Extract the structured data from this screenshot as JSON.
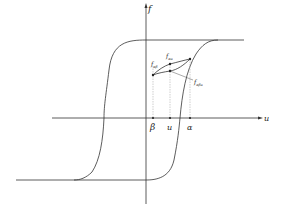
{
  "diagram": {
    "type": "hysteresis-loop",
    "axes": {
      "vertical_label": "f",
      "horizontal_label": "u"
    },
    "tick_labels": {
      "beta": "β",
      "u": "u",
      "alpha": "α"
    },
    "point_labels": {
      "f_ab": {
        "base": "f",
        "sub": "αβ"
      },
      "f_au": {
        "base": "f",
        "sub": "αu"
      },
      "f_abu": {
        "base": "f",
        "sub": "αβu"
      }
    },
    "colors": {
      "line": "#333333",
      "guide": "#b0b0b0",
      "background": "#ffffff"
    }
  }
}
